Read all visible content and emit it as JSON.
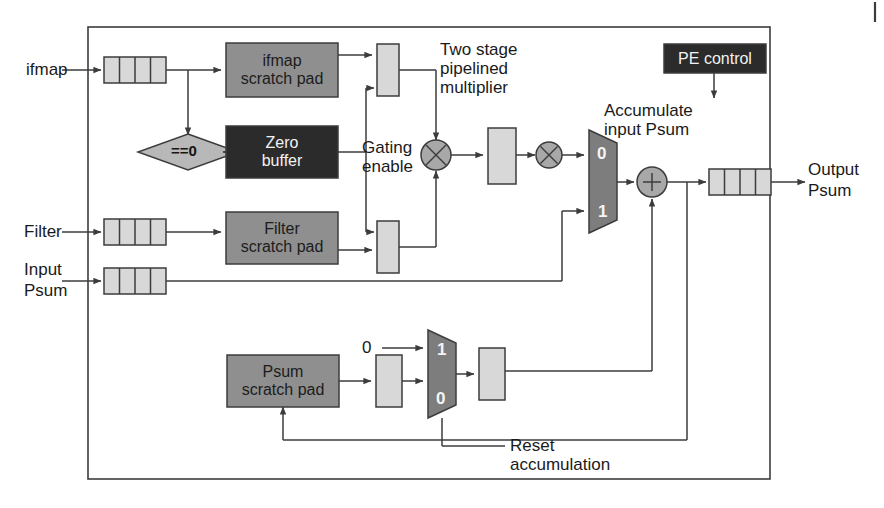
{
  "figure": {
    "colors": {
      "stroke": "#3c3c3c",
      "dark_block_fill": "#2b2b2b",
      "dark_block_text": "#f2f2f2",
      "gray_block_fill": "#8f8f8f",
      "light_reg_fill": "#d8d8d8",
      "mux_fill": "#7d7d7d",
      "op_circle_fill": "#a8a8a8",
      "background": "#ffffff",
      "text": "#1a1a1a"
    }
  },
  "io_labels": {
    "ifmap": "ifmap",
    "filter": "Filter",
    "input_psum_line1": "Input",
    "input_psum_line2": "Psum",
    "output_psum_line1": "Output",
    "output_psum_line2": "Psum"
  },
  "blocks": {
    "ifmap_scratch_pad": {
      "line1": "ifmap",
      "line2": "scratch pad",
      "style": "gray"
    },
    "zero_buffer": {
      "line1": "Zero",
      "line2": "buffer",
      "style": "dark"
    },
    "filter_scratch_pad": {
      "line1": "Filter",
      "line2": "scratch pad",
      "style": "gray"
    },
    "psum_scratch_pad": {
      "line1": "Psum",
      "line2": "scratch pad",
      "style": "gray"
    },
    "pe_control": {
      "line1": "PE control",
      "style": "dark"
    }
  },
  "annotations": {
    "two_stage_multiplier": "Two stage\npipelined\nmultiplier",
    "gating_enable": "Gating\nenable",
    "accumulate_input_psum": "Accumulate\ninput Psum",
    "reset_accumulation": "Reset\naccumulation",
    "zero_constant": "0",
    "comparator": "==0"
  },
  "mux_upper": {
    "name": "accumulate-input-psum-mux",
    "top_port": "0",
    "bottom_port": "1"
  },
  "mux_lower": {
    "name": "reset-accumulation-mux",
    "top_port": "1",
    "bottom_port": "0"
  },
  "operators": {
    "multiply_stage1": "×",
    "multiply_stage2": "×",
    "adder": "+"
  },
  "fifos": {
    "ifmap_fifo_cells": 4,
    "filter_fifo_cells": 4,
    "input_psum_fifo_cells": 4,
    "output_psum_fifo_cells": 4
  }
}
